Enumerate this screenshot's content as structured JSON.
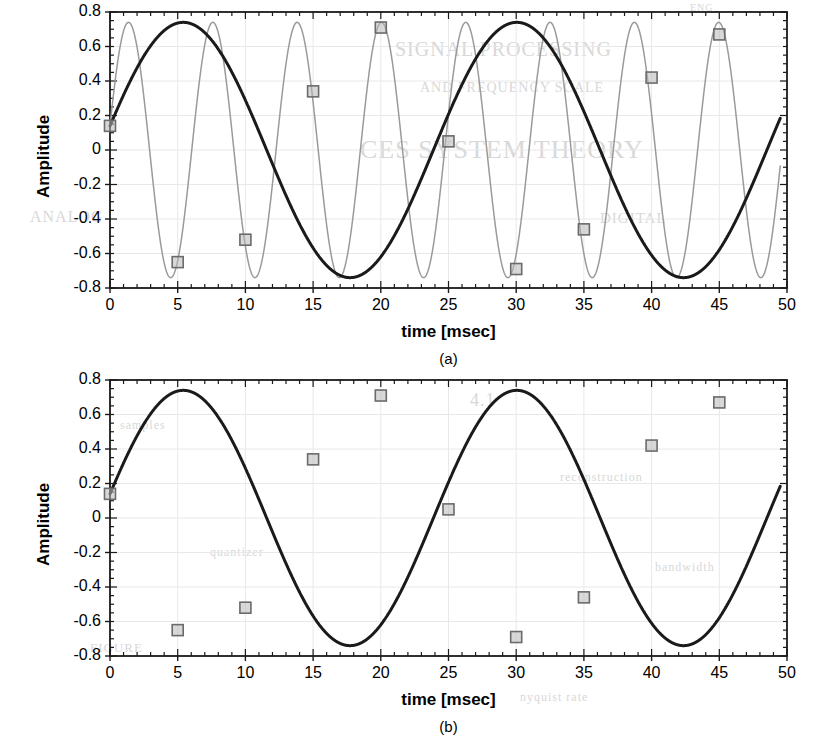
{
  "figure": {
    "ylabel": "Amplitude",
    "xlabel": "time [msec]",
    "caption_a": "(a)",
    "caption_b": "(b)",
    "yticks": [
      "0.8",
      "0.6",
      "0.4",
      "0.2",
      "0",
      "-0.2",
      "-0.4",
      "-0.6",
      "-0.8"
    ],
    "xticks": [
      "0",
      "5",
      "10",
      "15",
      "20",
      "25",
      "30",
      "35",
      "40",
      "45",
      "50"
    ],
    "colors": {
      "original_signal": "#9a9a9a",
      "alias_signal": "#1a1a1a",
      "marker_edge": "#6b6b6b",
      "marker_fill": "#b8b8b8",
      "axis": "#1a1a1a",
      "gridline": "#e8e8e8",
      "background": "#ffffff",
      "bleedthrough": "#d8d8d8"
    }
  },
  "bleedthrough": [
    {
      "text": "ENG",
      "x": 690,
      "y": 2,
      "size": 10
    },
    {
      "text": "SIGNAL PROCESSING",
      "x": 395,
      "y": 38,
      "size": 20
    },
    {
      "text": "AND FREQUENCY SCALE",
      "x": 420,
      "y": 80,
      "size": 14
    },
    {
      "text": "CES SYSTEM THEORY",
      "x": 360,
      "y": 135,
      "size": 26
    },
    {
      "text": "ANALOG",
      "x": 30,
      "y": 208,
      "size": 16
    },
    {
      "text": "DIGITAL",
      "x": 600,
      "y": 210,
      "size": 15
    },
    {
      "text": "4.1",
      "x": 470,
      "y": 390,
      "size": 18
    },
    {
      "text": "samples",
      "x": 120,
      "y": 418,
      "size": 12
    },
    {
      "text": "reconstruction",
      "x": 560,
      "y": 470,
      "size": 12
    },
    {
      "text": "quantizer",
      "x": 210,
      "y": 545,
      "size": 12
    },
    {
      "text": "bandwidth",
      "x": 655,
      "y": 560,
      "size": 12
    },
    {
      "text": "FIGURE",
      "x": 90,
      "y": 640,
      "size": 13
    },
    {
      "text": "nyquist rate",
      "x": 520,
      "y": 690,
      "size": 12
    }
  ],
  "chart_data": [
    {
      "id": "panel-a",
      "type": "line",
      "title": "",
      "caption": "(a)",
      "xlabel": "time [msec]",
      "ylabel": "Amplitude",
      "xlim": [
        0,
        50
      ],
      "ylim": [
        -0.8,
        0.8
      ],
      "xticks": [
        0,
        5,
        10,
        15,
        20,
        25,
        30,
        35,
        40,
        45,
        50
      ],
      "yticks": [
        -0.8,
        -0.6,
        -0.4,
        -0.2,
        0,
        0.2,
        0.4,
        0.6,
        0.8
      ],
      "grid": true,
      "legend": "none",
      "series": [
        {
          "name": "original high-frequency sinusoid",
          "color": "#9a9a9a",
          "kind": "sine",
          "amplitude": 0.74,
          "frequency_khz": 0.1606,
          "period_msec": 6.226,
          "phase_rad": 0.19,
          "t_start": 0,
          "t_end": 49.5,
          "markers": false,
          "peaks_t": [
            1.55,
            7.78,
            14.0,
            20.23,
            26.45,
            32.68,
            38.9,
            45.13
          ],
          "troughs_t": [
            4.66,
            10.89,
            17.11,
            23.34,
            29.56,
            35.79,
            42.01,
            48.24
          ]
        },
        {
          "name": "aliased low-frequency sinusoid",
          "color": "#1a1a1a",
          "kind": "sine",
          "amplitude": 0.74,
          "frequency_khz": 0.0406,
          "period_msec": 24.63,
          "phase_rad": 0.19,
          "t_start": 0,
          "t_end": 49.5,
          "markers": true,
          "peaks_t": [
            19.2,
            43.8
          ],
          "troughs_t": [
            6.88,
            31.5
          ]
        }
      ],
      "sample_points": {
        "name": "samples (every 5 msec, fs = 200 Hz)",
        "interval_msec": 5,
        "marker": "square",
        "t": [
          0,
          5,
          10,
          15,
          20,
          25,
          30,
          35,
          40,
          45
        ],
        "y": [
          0.14,
          -0.65,
          -0.52,
          0.34,
          0.71,
          0.05,
          -0.69,
          -0.46,
          0.42,
          0.67
        ]
      }
    },
    {
      "id": "panel-b",
      "type": "line",
      "title": "",
      "caption": "(b)",
      "xlabel": "time [msec]",
      "ylabel": "Amplitude",
      "xlim": [
        0,
        50
      ],
      "ylim": [
        -0.8,
        0.8
      ],
      "xticks": [
        0,
        5,
        10,
        15,
        20,
        25,
        30,
        35,
        40,
        45,
        50
      ],
      "yticks": [
        -0.8,
        -0.6,
        -0.4,
        -0.2,
        0,
        0.2,
        0.4,
        0.6,
        0.8
      ],
      "grid": true,
      "legend": "none",
      "series": [
        {
          "name": "aliased low-frequency sinusoid",
          "color": "#1a1a1a",
          "kind": "sine",
          "amplitude": 0.74,
          "frequency_khz": 0.0406,
          "period_msec": 24.63,
          "phase_rad": 0.19,
          "t_start": 0,
          "t_end": 49.5,
          "markers": true,
          "peaks_t": [
            19.2,
            43.8
          ],
          "troughs_t": [
            6.88,
            31.5
          ]
        }
      ],
      "sample_points": {
        "name": "samples (every 5 msec, fs = 200 Hz)",
        "interval_msec": 5,
        "marker": "square",
        "t": [
          0,
          5,
          10,
          15,
          20,
          25,
          30,
          35,
          40,
          45
        ],
        "y": [
          0.14,
          -0.65,
          -0.52,
          0.34,
          0.71,
          0.05,
          -0.69,
          -0.46,
          0.42,
          0.67
        ]
      }
    }
  ]
}
